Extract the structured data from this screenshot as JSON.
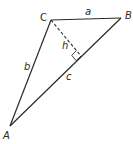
{
  "diagram": {
    "type": "triangle-with-altitude",
    "vertices": {
      "A": {
        "label": "A",
        "x": 10,
        "y": 126
      },
      "B": {
        "label": "B",
        "x": 121,
        "y": 18
      },
      "C": {
        "label": "C",
        "x": 51,
        "y": 20
      }
    },
    "sides": {
      "a": {
        "label": "a",
        "from": "C",
        "to": "B"
      },
      "b": {
        "label": "b",
        "from": "A",
        "to": "C"
      },
      "c": {
        "label": "c",
        "from": "A",
        "to": "B"
      }
    },
    "altitude": {
      "label": "h",
      "from": "C",
      "foot": {
        "x": 81,
        "y": 56
      },
      "style": "dashed"
    },
    "right_angle_marker": true,
    "colors": {
      "line": "#2a2a2a",
      "background": "#ffffff"
    }
  }
}
